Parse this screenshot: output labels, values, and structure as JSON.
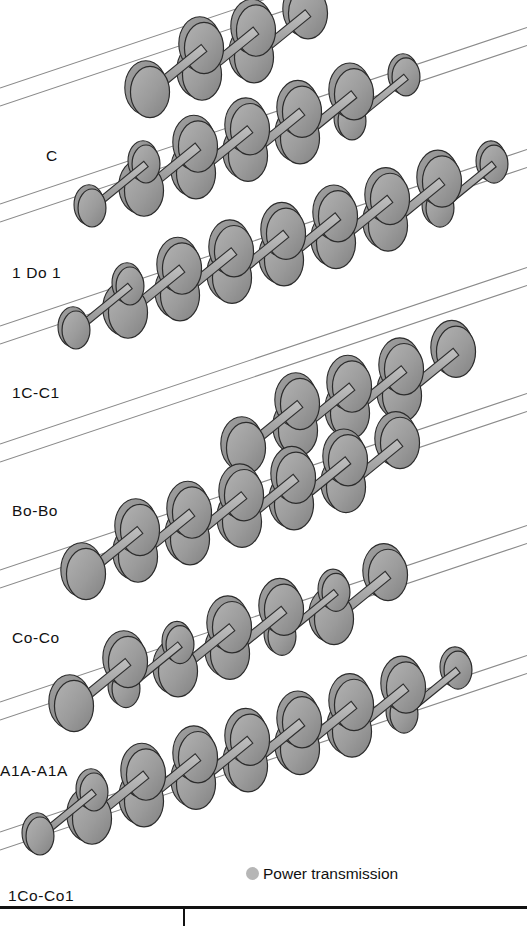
{
  "figure": {
    "kind": "technical-diagram",
    "background_color": "#ffffff",
    "width": 527,
    "height": 926
  },
  "style": {
    "wheel_face_color": "#9b9b9b",
    "wheel_rim_color": "#8d8d8d",
    "wheel_outline_color": "#2b2b2b",
    "axle_color": "#a8a8a8",
    "axle_outline_color": "#2f2f2f",
    "rail_color": "#8a8a8a",
    "label_color": "#111111",
    "rule_color": "#111111",
    "legend_dot_color": "#b6b6b6"
  },
  "legend": {
    "marker": "filled-circle",
    "label": "Power transmission"
  },
  "rows": [
    {
      "id": "c",
      "label": "C",
      "label_x": 46,
      "label_y": 148,
      "rail_y": 92,
      "start_x": 150,
      "axle_count": 3,
      "axles": [
        {
          "type": "driven",
          "powered": true
        },
        {
          "type": "driven",
          "powered": true
        },
        {
          "type": "driven",
          "powered": true
        }
      ]
    },
    {
      "id": "1do1",
      "label": "1 Do 1",
      "label_x": 12,
      "label_y": 265,
      "rail_y": 208,
      "start_x": 92,
      "axle_count": 6,
      "axles": [
        {
          "type": "carrying",
          "powered": false
        },
        {
          "type": "driven",
          "powered": true
        },
        {
          "type": "driven",
          "powered": true
        },
        {
          "type": "driven",
          "powered": true
        },
        {
          "type": "driven",
          "powered": true
        },
        {
          "type": "carrying",
          "powered": false
        }
      ]
    },
    {
      "id": "1c-c1",
      "label": "1C-C1",
      "label_x": 12,
      "label_y": 385,
      "rail_y": 330,
      "start_x": 76,
      "axle_count": 8,
      "axles": [
        {
          "type": "carrying",
          "powered": false
        },
        {
          "type": "driven",
          "powered": true
        },
        {
          "type": "driven",
          "powered": true
        },
        {
          "type": "driven",
          "powered": true
        },
        {
          "type": "driven",
          "powered": true
        },
        {
          "type": "driven",
          "powered": true
        },
        {
          "type": "driven",
          "powered": true
        },
        {
          "type": "carrying",
          "powered": false
        }
      ]
    },
    {
      "id": "bo-bo",
      "label": "Bo-Bo",
      "label_x": 12,
      "label_y": 503,
      "rail_y": 448,
      "start_x": 246,
      "axle_count": 4,
      "axles": [
        {
          "type": "driven",
          "powered": true
        },
        {
          "type": "driven",
          "powered": true
        },
        {
          "type": "driven",
          "powered": true
        },
        {
          "type": "driven",
          "powered": true
        }
      ]
    },
    {
      "id": "co-co",
      "label": "Co-Co",
      "label_x": 12,
      "label_y": 630,
      "rail_y": 574,
      "start_x": 86,
      "axle_count": 6,
      "axles": [
        {
          "type": "driven",
          "powered": true
        },
        {
          "type": "driven",
          "powered": true
        },
        {
          "type": "driven",
          "powered": true
        },
        {
          "type": "driven",
          "powered": true
        },
        {
          "type": "driven",
          "powered": true
        },
        {
          "type": "driven",
          "powered": true
        }
      ]
    },
    {
      "id": "a1a-a1a",
      "label": "A1A-A1A",
      "label_x": 0,
      "label_y": 763,
      "rail_y": 706,
      "start_x": 74,
      "axle_count": 6,
      "axles": [
        {
          "type": "driven",
          "powered": true
        },
        {
          "type": "carrying",
          "powered": false
        },
        {
          "type": "driven",
          "powered": true
        },
        {
          "type": "driven",
          "powered": true
        },
        {
          "type": "carrying",
          "powered": false
        },
        {
          "type": "driven",
          "powered": true
        }
      ]
    },
    {
      "id": "1co-co1",
      "label": "1Co-Co1",
      "label_x": 8,
      "label_y": 888,
      "rail_y": 836,
      "start_x": 40,
      "axle_count": 8,
      "axles": [
        {
          "type": "carrying",
          "powered": false
        },
        {
          "type": "driven",
          "powered": true
        },
        {
          "type": "driven",
          "powered": true
        },
        {
          "type": "driven",
          "powered": true
        },
        {
          "type": "driven",
          "powered": true
        },
        {
          "type": "driven",
          "powered": true
        },
        {
          "type": "driven",
          "powered": true
        },
        {
          "type": "carrying",
          "powered": false
        }
      ]
    }
  ],
  "geometry": {
    "rail_slope_dy_per_dx": -0.335,
    "rail_gauge_offset_x": 52,
    "rail_gauge_offset_y": 44,
    "axle_pitch_x": 52,
    "driven_wheel_rx": 21,
    "driven_wheel_ry": 27,
    "carrying_wheel_rx": 15,
    "carrying_wheel_ry": 20,
    "axle_length": 54,
    "axle_thickness": 9
  }
}
